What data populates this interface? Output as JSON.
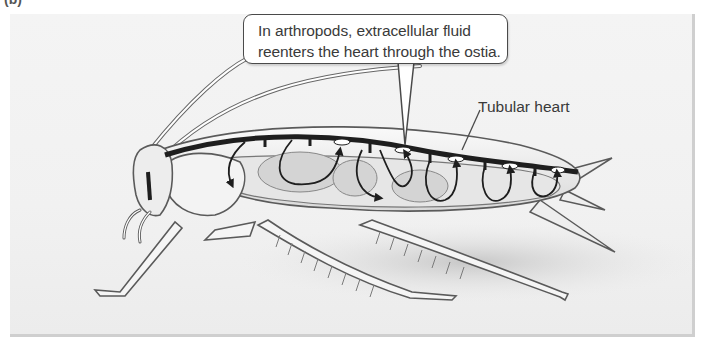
{
  "figure": {
    "panel_label_fragment": "(b)"
  },
  "callout": {
    "line1": "In arthropods, extracellular fluid",
    "line2": "reenters the heart through the ostia."
  },
  "labels": {
    "tubular_heart": "Tubular heart"
  },
  "colors": {
    "background": "#f1f1f1",
    "outline": "#555555",
    "heart": "#1e1e1e",
    "text": "#3a3a3a"
  }
}
